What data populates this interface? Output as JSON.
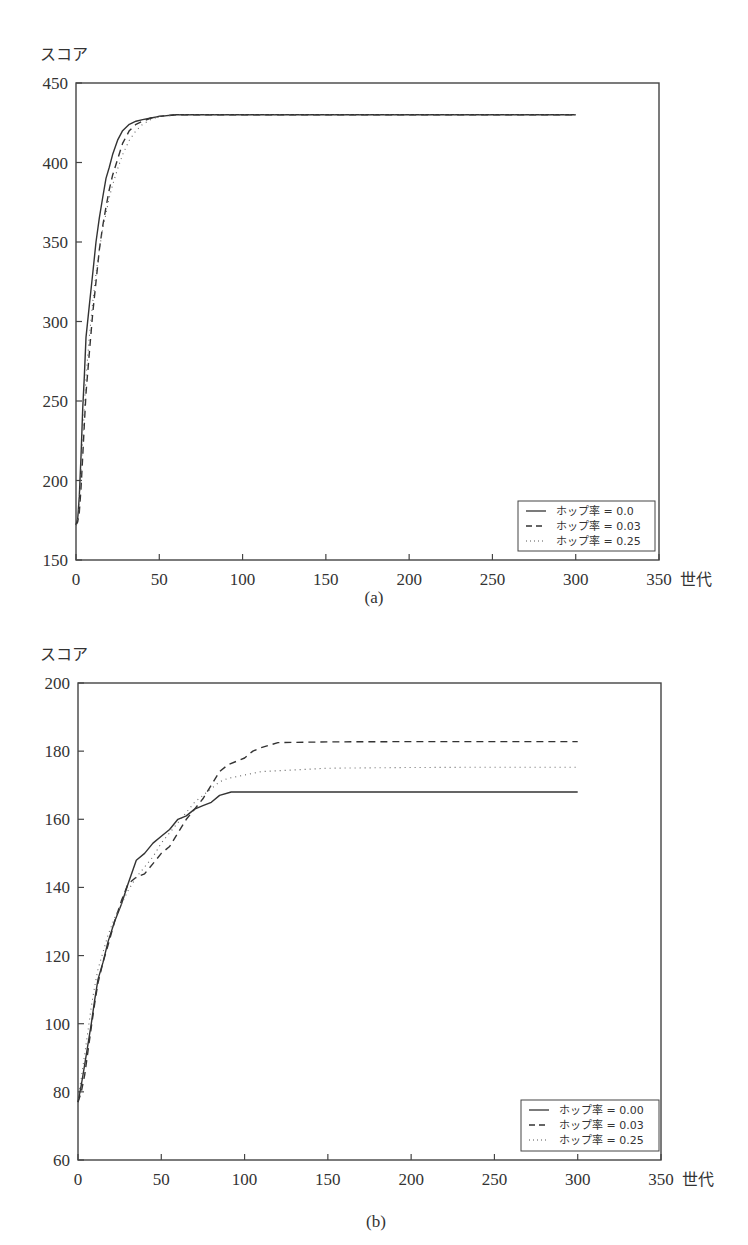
{
  "chart_data": [
    {
      "id": "a",
      "type": "line",
      "caption": "(a)",
      "ylabel": "スコア",
      "xlabel": "世代",
      "xlim": [
        0,
        350
      ],
      "ylim": [
        150,
        450
      ],
      "xticks": [
        0,
        50,
        100,
        150,
        200,
        250,
        300,
        350
      ],
      "yticks": [
        150,
        200,
        250,
        300,
        350,
        400,
        450
      ],
      "grid": false,
      "legend_position": "lower right",
      "series": [
        {
          "name": "ホップ率 = 0.0",
          "style": "solid",
          "x": [
            0,
            1,
            2,
            3,
            4,
            5,
            6,
            8,
            10,
            12,
            14,
            16,
            18,
            20,
            22,
            25,
            28,
            32,
            36,
            40,
            45,
            50,
            60,
            70,
            100,
            150,
            200,
            250,
            300
          ],
          "y": [
            172,
            176,
            190,
            215,
            245,
            265,
            290,
            310,
            330,
            350,
            365,
            378,
            390,
            397,
            405,
            414,
            420,
            424,
            426,
            427,
            428,
            429,
            430,
            430,
            430,
            430,
            430,
            430,
            430
          ]
        },
        {
          "name": "ホップ率 = 0.03",
          "style": "dashed",
          "x": [
            0,
            1,
            2,
            3,
            4,
            5,
            6,
            8,
            10,
            12,
            14,
            16,
            18,
            20,
            22,
            25,
            28,
            32,
            36,
            40,
            45,
            50,
            60,
            70,
            100,
            150,
            200,
            250,
            300
          ],
          "y": [
            172,
            174,
            180,
            195,
            215,
            235,
            255,
            280,
            305,
            325,
            345,
            360,
            372,
            383,
            392,
            402,
            412,
            420,
            424,
            426,
            428,
            429,
            430,
            430,
            430,
            430,
            430,
            430,
            430
          ]
        },
        {
          "name": "ホップ率 = 0.25",
          "style": "dotted",
          "x": [
            0,
            1,
            2,
            3,
            4,
            5,
            6,
            8,
            10,
            12,
            14,
            16,
            18,
            20,
            22,
            25,
            28,
            32,
            36,
            40,
            45,
            50,
            60,
            70,
            100,
            150,
            200,
            250,
            300
          ],
          "y": [
            172,
            175,
            185,
            205,
            225,
            245,
            265,
            290,
            312,
            330,
            345,
            358,
            368,
            378,
            386,
            396,
            405,
            414,
            420,
            424,
            427,
            429,
            430,
            430,
            430,
            430,
            430,
            430,
            430
          ]
        }
      ]
    },
    {
      "id": "b",
      "type": "line",
      "caption": "(b)",
      "ylabel": "スコア",
      "xlabel": "世代",
      "xlim": [
        0,
        350
      ],
      "ylim": [
        60,
        200
      ],
      "xticks": [
        0,
        50,
        100,
        150,
        200,
        250,
        300,
        350
      ],
      "yticks": [
        60,
        80,
        100,
        120,
        140,
        160,
        180,
        200
      ],
      "grid": false,
      "legend_position": "lower right",
      "series": [
        {
          "name": "ホップ率 = 0.00",
          "style": "solid",
          "x": [
            0,
            2,
            4,
            6,
            8,
            10,
            12,
            15,
            18,
            22,
            26,
            30,
            35,
            40,
            45,
            50,
            55,
            60,
            65,
            70,
            75,
            80,
            85,
            92,
            100,
            150,
            200,
            250,
            300
          ],
          "y": [
            77,
            82,
            88,
            94,
            100,
            107,
            113,
            118,
            124,
            130,
            135,
            141,
            148,
            150,
            153,
            155,
            157,
            160,
            161,
            163,
            164,
            165,
            167,
            168,
            168,
            168,
            168,
            168,
            168
          ]
        },
        {
          "name": "ホップ率 = 0.03",
          "style": "dashed",
          "x": [
            0,
            2,
            4,
            6,
            8,
            10,
            12,
            15,
            18,
            22,
            26,
            30,
            35,
            40,
            45,
            50,
            55,
            60,
            65,
            70,
            75,
            80,
            85,
            90,
            95,
            100,
            105,
            110,
            120,
            150,
            200,
            250,
            300
          ],
          "y": [
            77,
            80,
            85,
            92,
            99,
            106,
            112,
            118,
            123,
            130,
            136,
            141,
            143,
            144,
            147,
            150,
            152,
            156,
            160,
            163,
            166,
            170,
            174,
            176,
            177,
            178,
            180,
            181,
            182.5,
            182.7,
            182.8,
            182.8,
            182.8
          ]
        },
        {
          "name": "ホップ率 = 0.25",
          "style": "dotted",
          "x": [
            0,
            2,
            4,
            6,
            8,
            10,
            12,
            15,
            18,
            22,
            26,
            30,
            35,
            40,
            45,
            50,
            55,
            60,
            65,
            70,
            75,
            80,
            85,
            90,
            100,
            110,
            150,
            200,
            250,
            300
          ],
          "y": [
            78,
            84,
            91,
            98,
            105,
            111,
            116,
            121,
            126,
            131,
            135,
            139,
            143,
            146,
            149,
            153,
            156,
            159,
            162,
            165,
            167,
            169,
            171,
            172,
            173,
            174,
            175,
            175.2,
            175.3,
            175.3
          ]
        }
      ]
    }
  ],
  "charts": {
    "a": {
      "ylabel": "スコア",
      "xlabel": "世代",
      "caption": "(a)",
      "yticks": [
        "450",
        "400",
        "350",
        "300",
        "250",
        "200",
        "150"
      ],
      "xticks": [
        "0",
        "50",
        "100",
        "150",
        "200",
        "250",
        "300",
        "350"
      ],
      "legend": [
        "ホップ率 = 0.0",
        "ホップ率 = 0.03",
        "ホップ率 = 0.25"
      ]
    },
    "b": {
      "ylabel": "スコア",
      "xlabel": "世代",
      "caption": "(b)",
      "yticks": [
        "200",
        "180",
        "160",
        "140",
        "120",
        "100",
        "80",
        "60"
      ],
      "xticks": [
        "0",
        "50",
        "100",
        "150",
        "200",
        "250",
        "300",
        "350"
      ],
      "legend": [
        "ホップ率 = 0.00",
        "ホップ率 = 0.03",
        "ホップ率 = 0.25"
      ]
    }
  },
  "colors": {
    "line": "#333333",
    "axis": "#444444",
    "background": "#ffffff"
  }
}
